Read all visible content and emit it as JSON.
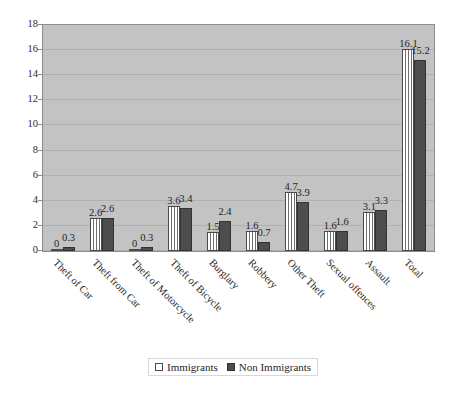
{
  "chart_data": {
    "type": "bar",
    "title": "",
    "subtitle": "",
    "xlabel": "",
    "ylabel": "",
    "ylim": [
      0,
      18
    ],
    "ytick_step": 2,
    "yticks": [
      "18",
      "16",
      "14",
      "12",
      "10",
      "8",
      "6",
      "4",
      "2",
      "0"
    ],
    "grid": true,
    "grid_axis": "y",
    "legend_position": "bottom-center",
    "categories": [
      "Theft of Car",
      "Theft from Car",
      "Theft of Motorcycle",
      "Theft of Bicycle",
      "Burglary",
      "Robbery",
      "Other Theft",
      "Sexual offences",
      "Assault",
      "Total"
    ],
    "series": [
      {
        "name": "Immigrants",
        "color": "#ffffff",
        "pattern": "vertical-stripes",
        "values": [
          0,
          2.6,
          0,
          3.6,
          1.5,
          1.6,
          4.7,
          1.6,
          3.1,
          16.1
        ],
        "labels": [
          "0",
          "2.6",
          "0",
          "3.6",
          "1.5",
          "1.6",
          "4.7",
          "1.6",
          "3.1",
          "16.1"
        ]
      },
      {
        "name": "Non Immigrants",
        "color": "#4d4d4d",
        "pattern": "solid",
        "values": [
          0.3,
          2.6,
          0.3,
          3.4,
          2.4,
          0.7,
          3.9,
          1.6,
          3.3,
          15.2
        ],
        "labels": [
          "0.3",
          "2.6",
          "0.3",
          "3.4",
          "2.4",
          "0.7",
          "3.9",
          "1.6",
          "3.3",
          "15.2"
        ]
      }
    ],
    "plot_background": "#c3c3c3",
    "plot_border": "#8d8d8d"
  },
  "legend": {
    "items": [
      {
        "label": "Immigrants"
      },
      {
        "label": "Non Immigrants"
      }
    ]
  }
}
